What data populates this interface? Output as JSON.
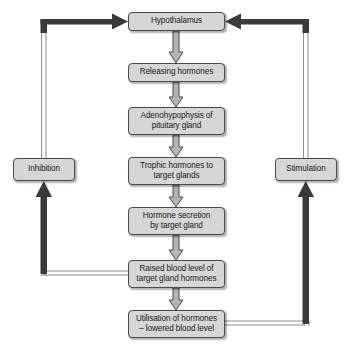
{
  "diagram": {
    "colors": {
      "background": "#ffffff",
      "box_fill": "#d6d6d6",
      "box_border": "#4a4a4a",
      "text": "#1a1a1a",
      "thin_arrow_fill": "#b3b3b3",
      "thin_arrow_stroke": "#4a4a4a",
      "thick_arrow": "#3a3a3a"
    },
    "nodes": {
      "hypothalamus": "Hypothalamus",
      "releasing_hormones": "Releasing hormones",
      "adenohypophysis": "Adenohypophysis of\npituitary gland",
      "trophic_hormones": "Trophic hormones to\ntarget glands",
      "hormone_secretion": "Hormone secretion\nby target gland",
      "raised_blood_level": "Raised blood level of\ntarget gland hormones",
      "utilisation": "Utilisation of hormones\n– lowered blood level",
      "inhibition": "Inhibition",
      "stimulation": "Stimulation"
    },
    "flow": [
      {
        "from": "hypothalamus",
        "to": "releasing_hormones",
        "style": "block-arrow-down"
      },
      {
        "from": "releasing_hormones",
        "to": "adenohypophysis",
        "style": "block-arrow-down"
      },
      {
        "from": "adenohypophysis",
        "to": "trophic_hormones",
        "style": "block-arrow-down"
      },
      {
        "from": "trophic_hormones",
        "to": "hormone_secretion",
        "style": "block-arrow-down"
      },
      {
        "from": "hormone_secretion",
        "to": "raised_blood_level",
        "style": "block-arrow-down"
      },
      {
        "from": "raised_blood_level",
        "to": "utilisation",
        "style": "block-arrow-down"
      },
      {
        "from": "raised_blood_level",
        "to": "inhibition",
        "style": "thick-feedback-left"
      },
      {
        "from": "inhibition",
        "to": "hypothalamus",
        "style": "thick-feedback-up-right"
      },
      {
        "from": "utilisation",
        "to": "stimulation",
        "style": "thick-feedback-right"
      },
      {
        "from": "stimulation",
        "to": "hypothalamus",
        "style": "thick-feedback-up-left"
      }
    ]
  }
}
